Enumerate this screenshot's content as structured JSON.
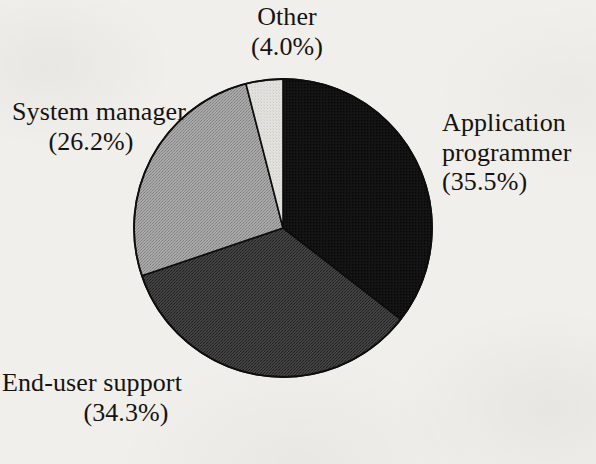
{
  "chart_data": {
    "type": "pie",
    "title": "",
    "labels": [
      "Application programmer",
      "End-user support",
      "System manager",
      "Other"
    ],
    "values": [
      35.5,
      34.3,
      26.2,
      4.0
    ],
    "value_unit": "%",
    "legend": "none",
    "grid": false,
    "start_angle_deg": 0,
    "direction": "clockwise",
    "slices": [
      {
        "name": "Application programmer",
        "value": 35.5,
        "value_text": "(35.5%)",
        "color": "#111111",
        "start_deg": 0,
        "end_deg": 127.8,
        "label_position": "right"
      },
      {
        "name": "End-user support",
        "value": 34.3,
        "value_text": "(34.3%)",
        "color": "#3d3d3d",
        "start_deg": 127.8,
        "end_deg": 251.28,
        "label_position": "bottom-left"
      },
      {
        "name": "System manager",
        "value": 26.2,
        "value_text": "(26.2%)",
        "color": "#9e9e9e",
        "start_deg": 251.28,
        "end_deg": 345.6,
        "label_position": "left"
      },
      {
        "name": "Other",
        "value": 4.0,
        "value_text": "(4.0%)",
        "color": "#dcdcdc",
        "start_deg": 345.6,
        "end_deg": 360,
        "label_position": "top"
      }
    ],
    "geometry": {
      "center_x": 283,
      "center_y": 228,
      "radius": 149,
      "outline_color": "#0d0d0d",
      "outline_width": 1.6
    },
    "background_color": "#f1efeb"
  },
  "labels": {
    "other": {
      "name": "Other",
      "value_text": "(4.0%)"
    },
    "system_manager": {
      "name": "System manager",
      "value_text": "(26.2%)"
    },
    "application_programmer": {
      "name_line1": "Application",
      "name_line2": "programmer",
      "value_text": "(35.5%)"
    },
    "end_user_support": {
      "name": "End-user support",
      "value_text": "(34.3%)"
    }
  }
}
